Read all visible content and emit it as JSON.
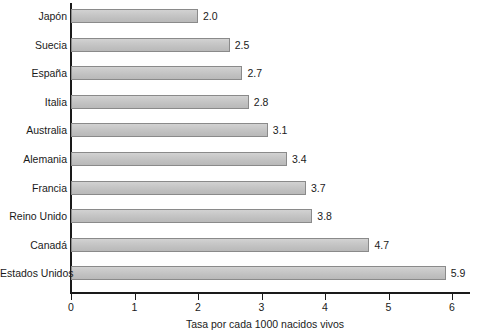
{
  "chart_data": {
    "type": "bar",
    "orientation": "horizontal",
    "title": "",
    "subtitle": "",
    "xlabel": "Tasa por cada 1000 nacidos vivos",
    "ylabel": "",
    "xlim": [
      0,
      6
    ],
    "xticks": [
      "0",
      "1",
      "2",
      "3",
      "4",
      "5",
      "6"
    ],
    "grid": false,
    "legend": null,
    "categories": [
      "Japón",
      "Suecia",
      "España",
      "Italia",
      "Australia",
      "Alemania",
      "Francia",
      "Reino Unido",
      "Canadá",
      "Estados Unidos"
    ],
    "values": [
      2.0,
      2.5,
      2.7,
      2.8,
      3.1,
      3.4,
      3.7,
      3.8,
      4.7,
      5.9
    ],
    "value_labels": [
      "2.0",
      "2.5",
      "2.7",
      "2.8",
      "3.1",
      "3.4",
      "3.7",
      "3.8",
      "4.7",
      "5.9"
    ]
  },
  "style": {
    "bar_fill": "#c6c6c6",
    "bar_border": "#8a8a8a",
    "axis_color": "#1a1a1a",
    "text_color": "#1a1a1a",
    "background": "#ffffff"
  }
}
